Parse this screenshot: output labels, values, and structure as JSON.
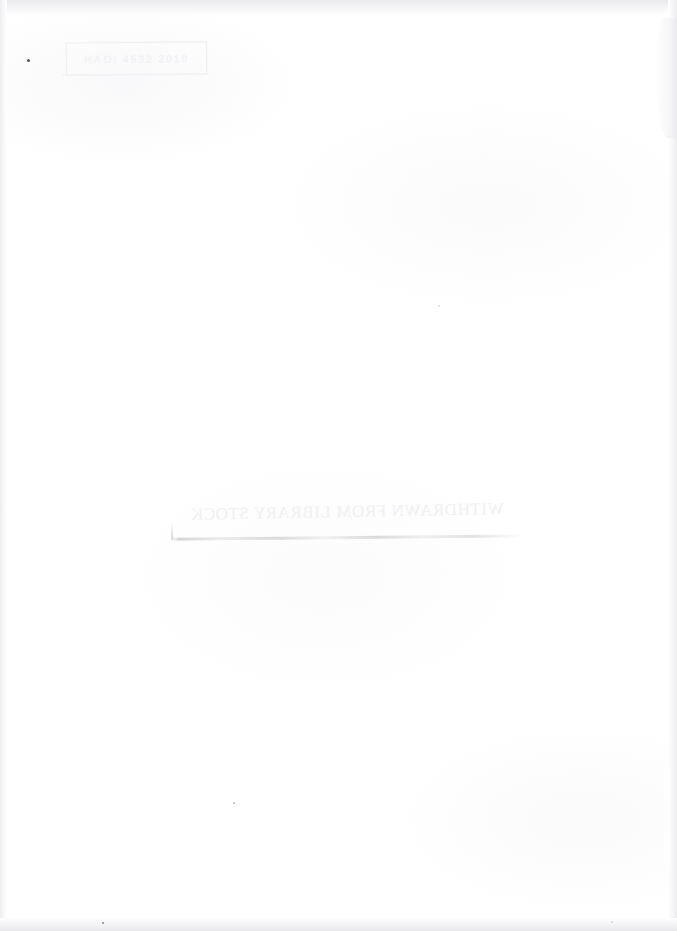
{
  "document": {
    "type": "scanned-book-page",
    "page_kind": "blank-endpaper-verso",
    "background_color": "#ffffff",
    "width_px": 677,
    "height_px": 931
  },
  "stamp": {
    "name": "library-date-stamp",
    "text": "HAOI 4532 2010",
    "ink_color": "#f2f2f4",
    "border_color": "#f0f0f2"
  },
  "showthrough": {
    "name": "faint-showthrough-band",
    "text": "· · ·  ·· · ·   ·  ··  ·  · ·   ··· ·  ·· ·   · ··  ·",
    "color": "#fbfbfc"
  },
  "withdrawn_mark": {
    "name": "withdrawn-from-library-stock",
    "text": "WITHDRAWN FROM LIBRARY STOCK",
    "orientation": "mirrored",
    "ink_color": "#f0f0f2"
  },
  "smudge": {
    "name": "pencil-smudge-line",
    "color": "#78787d"
  },
  "specks": [
    {
      "name": "scan-speck-upper-left",
      "color": "#2c2c30"
    },
    {
      "name": "scan-speck-lower-center",
      "color": "#2c2c30"
    },
    {
      "name": "scan-speck-bottom-left",
      "color": "#2c2c30"
    },
    {
      "name": "scan-speck-mid-right",
      "color": "#2c2c30"
    },
    {
      "name": "scan-speck-bottom-right",
      "color": "#2c2c30"
    }
  ],
  "edges": {
    "top_shadow_color": "#e9e9ec",
    "left_shadow_color": "#eeeef1",
    "right_shadow_color": "#ececef",
    "bottom_shadow_color": "#e8e8ec"
  }
}
